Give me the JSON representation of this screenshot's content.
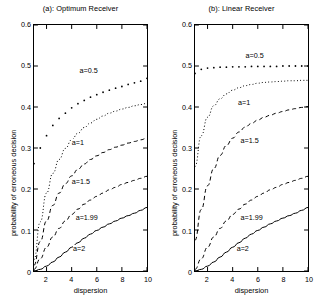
{
  "figure": {
    "width": 322,
    "height": 307,
    "background": "#ffffff",
    "foreground": "#000000"
  },
  "axes_common": {
    "xlabel": "dispersion",
    "ylabel": "probability of erroneous decision",
    "xlim": [
      1,
      10
    ],
    "ylim": [
      0,
      0.6
    ],
    "xticks": [
      2,
      4,
      6,
      8,
      10
    ],
    "xtick_labels": [
      "2",
      "4",
      "6",
      "8",
      "10"
    ],
    "yticks": [
      0,
      0.1,
      0.2,
      0.3,
      0.4,
      0.5,
      0.6
    ],
    "ytick_labels": [
      "0",
      "0.1",
      "0.2",
      "0.3",
      "0.4",
      "0.5",
      "0.6"
    ],
    "grid": false,
    "legend": "inline-curve-labels"
  },
  "chart_data": [
    {
      "type": "line",
      "panel": "a",
      "title": "(a): Optimum Receiver",
      "xlabel": "dispersion",
      "ylabel": "probability of erroneous decision",
      "xlim": [
        1,
        10
      ],
      "ylim": [
        0,
        0.6
      ],
      "xticks": [
        2,
        4,
        6,
        8,
        10
      ],
      "yticks": [
        0,
        0.1,
        0.2,
        0.3,
        0.4,
        0.5,
        0.6
      ],
      "grid": false,
      "x": [
        1,
        1.5,
        2,
        2.5,
        3,
        3.5,
        4,
        4.5,
        5,
        5.5,
        6,
        6.5,
        7,
        7.5,
        8,
        8.5,
        9,
        9.5,
        10
      ],
      "series": [
        {
          "name": "a=0.5",
          "label": "a=0.5",
          "style": "dotted-markers",
          "marker": "dot",
          "label_x": 4.6,
          "label_y": 0.487,
          "values": [
            0.262,
            0.3,
            0.33,
            0.355,
            0.372,
            0.385,
            0.398,
            0.408,
            0.416,
            0.424,
            0.43,
            0.436,
            0.441,
            0.446,
            0.45,
            0.455,
            0.459,
            0.463,
            0.47
          ]
        },
        {
          "name": "a=1",
          "label": "a=1",
          "style": "dotted",
          "label_x": 4.0,
          "label_y": 0.312,
          "values": [
            0.028,
            0.12,
            0.19,
            0.238,
            0.272,
            0.299,
            0.32,
            0.336,
            0.35,
            0.361,
            0.37,
            0.378,
            0.385,
            0.39,
            0.395,
            0.399,
            0.403,
            0.406,
            0.409
          ]
        },
        {
          "name": "a=1.5",
          "label": "a=1.5",
          "style": "dashed",
          "label_x": 4.0,
          "label_y": 0.218,
          "values": [
            0.014,
            0.072,
            0.122,
            0.16,
            0.19,
            0.213,
            0.232,
            0.248,
            0.261,
            0.272,
            0.281,
            0.289,
            0.296,
            0.302,
            0.307,
            0.312,
            0.316,
            0.32,
            0.324
          ]
        },
        {
          "name": "a=1.99",
          "label": "a=1.99",
          "style": "dashed",
          "label_x": 4.3,
          "label_y": 0.131,
          "values": [
            0.004,
            0.03,
            0.058,
            0.083,
            0.104,
            0.122,
            0.138,
            0.151,
            0.163,
            0.173,
            0.182,
            0.19,
            0.198,
            0.204,
            0.211,
            0.216,
            0.221,
            0.226,
            0.231
          ]
        },
        {
          "name": "a=2",
          "label": "a=2",
          "style": "solid",
          "label_x": 4.1,
          "label_y": 0.055,
          "values": [
            0.0,
            0.004,
            0.012,
            0.022,
            0.034,
            0.046,
            0.058,
            0.069,
            0.08,
            0.09,
            0.099,
            0.107,
            0.115,
            0.122,
            0.129,
            0.135,
            0.141,
            0.148,
            0.155
          ]
        }
      ]
    },
    {
      "type": "line",
      "panel": "b",
      "title": "(b): Linear Receiver",
      "xlabel": "dispersion",
      "ylabel": "probability of erroneous decision",
      "xlim": [
        1,
        10
      ],
      "ylim": [
        0,
        0.6
      ],
      "xticks": [
        2,
        4,
        6,
        8,
        10
      ],
      "yticks": [
        0,
        0.1,
        0.2,
        0.3,
        0.4,
        0.5,
        0.6
      ],
      "grid": false,
      "x": [
        1,
        1.5,
        2,
        2.5,
        3,
        3.5,
        4,
        4.5,
        5,
        5.5,
        6,
        6.5,
        7,
        7.5,
        8,
        8.5,
        9,
        9.5,
        10
      ],
      "series": [
        {
          "name": "a=0.5",
          "label": "a=0.5",
          "style": "dotted-markers",
          "marker": "dot",
          "label_x": 5.0,
          "label_y": 0.523,
          "values": [
            0.482,
            0.492,
            0.495,
            0.496,
            0.497,
            0.497,
            0.498,
            0.498,
            0.498,
            0.499,
            0.499,
            0.499,
            0.499,
            0.499,
            0.5,
            0.5,
            0.5,
            0.5,
            0.5
          ]
        },
        {
          "name": "a=1",
          "label": "a=1",
          "style": "dotted",
          "label_x": 4.4,
          "label_y": 0.408,
          "values": [
            0.255,
            0.33,
            0.375,
            0.403,
            0.42,
            0.432,
            0.441,
            0.447,
            0.452,
            0.455,
            0.458,
            0.46,
            0.461,
            0.462,
            0.463,
            0.464,
            0.464,
            0.465,
            0.465
          ]
        },
        {
          "name": "a=1.5",
          "label": "a=1.5",
          "style": "dashed",
          "label_x": 4.6,
          "label_y": 0.318,
          "values": [
            0.075,
            0.15,
            0.208,
            0.25,
            0.282,
            0.306,
            0.324,
            0.339,
            0.351,
            0.36,
            0.368,
            0.375,
            0.38,
            0.385,
            0.389,
            0.393,
            0.396,
            0.399,
            0.401
          ]
        },
        {
          "name": "a=1.99",
          "label": "a=1.99",
          "style": "dashed",
          "label_x": 4.6,
          "label_y": 0.131,
          "values": [
            0.004,
            0.03,
            0.058,
            0.083,
            0.104,
            0.122,
            0.138,
            0.151,
            0.163,
            0.173,
            0.182,
            0.19,
            0.198,
            0.204,
            0.211,
            0.216,
            0.221,
            0.226,
            0.231
          ]
        },
        {
          "name": "a=2",
          "label": "a=2",
          "style": "solid",
          "label_x": 4.3,
          "label_y": 0.055,
          "values": [
            0.0,
            0.004,
            0.012,
            0.022,
            0.034,
            0.046,
            0.058,
            0.069,
            0.08,
            0.09,
            0.099,
            0.107,
            0.115,
            0.122,
            0.129,
            0.135,
            0.141,
            0.148,
            0.155
          ]
        }
      ]
    }
  ]
}
